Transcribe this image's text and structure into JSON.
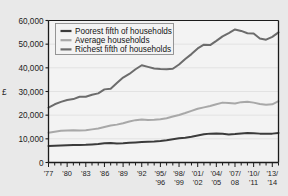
{
  "chart_data": {
    "type": "line",
    "title": "",
    "xlabel": "",
    "ylabel": "£",
    "ylim": [
      0,
      60000
    ],
    "xlim": [
      1977,
      2014
    ],
    "grid": true,
    "legend_position": "top-left",
    "ytick_labels": [
      "0",
      "10,000",
      "20,000",
      "30,000",
      "40,000",
      "50,000",
      "60,000"
    ],
    "ytick_values": [
      0,
      10000,
      20000,
      30000,
      40000,
      50000,
      60000
    ],
    "x": [
      1977,
      1978,
      1979,
      1980,
      1981,
      1982,
      1983,
      1984,
      1985,
      1986,
      1987,
      1988,
      1989,
      1990,
      1991,
      1992,
      1993,
      1994,
      1995,
      1996,
      1997,
      1998,
      1999,
      2000,
      2001,
      2002,
      2003,
      2004,
      2005,
      2006,
      2007,
      2008,
      2009,
      2010,
      2011,
      2012,
      2013,
      2014
    ],
    "xtick_labels": [
      {
        "top": "'77",
        "bottom": ""
      },
      {
        "top": "'80",
        "bottom": ""
      },
      {
        "top": "'83",
        "bottom": ""
      },
      {
        "top": "'86",
        "bottom": ""
      },
      {
        "top": "'89",
        "bottom": ""
      },
      {
        "top": "'92",
        "bottom": ""
      },
      {
        "top": "'95/",
        "bottom": "'96"
      },
      {
        "top": "'98/",
        "bottom": "'99"
      },
      {
        "top": "'01/",
        "bottom": "'02"
      },
      {
        "top": "'04/",
        "bottom": "'05"
      },
      {
        "top": "'07/",
        "bottom": "08"
      },
      {
        "top": "'10/",
        "bottom": "'11"
      },
      {
        "top": "'13/",
        "bottom": "'14"
      }
    ],
    "xtick_label_years": [
      1977,
      1980,
      1983,
      1986,
      1989,
      1992,
      1995,
      1998,
      2001,
      2004,
      2007,
      2010,
      2013
    ],
    "series": [
      {
        "name": "Poorest fifth of households",
        "color": "#3b3b3b",
        "width": 2.0,
        "values": [
          7000,
          7100,
          7200,
          7300,
          7350,
          7400,
          7450,
          7600,
          7800,
          8100,
          8200,
          8000,
          8100,
          8300,
          8500,
          8700,
          8800,
          8900,
          9100,
          9400,
          9800,
          10200,
          10500,
          10900,
          11400,
          11900,
          12200,
          12300,
          12100,
          11800,
          12000,
          12300,
          12500,
          12400,
          12200,
          12100,
          12200,
          12500
        ]
      },
      {
        "name": "Average households",
        "color": "#a8a8a8",
        "width": 2.0,
        "values": [
          12600,
          13000,
          13400,
          13500,
          13600,
          13500,
          13600,
          14000,
          14400,
          15000,
          15600,
          16000,
          16600,
          17300,
          17900,
          18200,
          18000,
          18100,
          18300,
          18700,
          19400,
          20100,
          20900,
          21800,
          22700,
          23300,
          23900,
          24600,
          25300,
          25100,
          24900,
          25500,
          25700,
          25300,
          24700,
          24400,
          24600,
          25900
        ]
      },
      {
        "name": "Richest fifth of households",
        "color": "#6c6c6c",
        "width": 2.0,
        "values": [
          23200,
          24600,
          25600,
          26400,
          26800,
          27800,
          27800,
          28600,
          29200,
          30900,
          31200,
          33600,
          35900,
          37400,
          39400,
          41100,
          40400,
          39700,
          39500,
          39400,
          39600,
          41400,
          43700,
          45800,
          48200,
          49800,
          49600,
          51400,
          53300,
          54700,
          56200,
          55600,
          54600,
          54500,
          52400,
          51900,
          53100,
          55000
        ]
      }
    ]
  },
  "legend": {
    "items": [
      {
        "label": "Poorest fifth of households"
      },
      {
        "label": "Average households"
      },
      {
        "label": "Richest fifth of households"
      }
    ]
  },
  "colors": {
    "page_background": "#e9e9e9",
    "plot_background": "#f3f3f3",
    "axis": "#1b1b1b",
    "gridline": "#e2e2e2",
    "legend_box_fill": "#f3f3f3",
    "legend_box_border": "#8c8c8c"
  }
}
